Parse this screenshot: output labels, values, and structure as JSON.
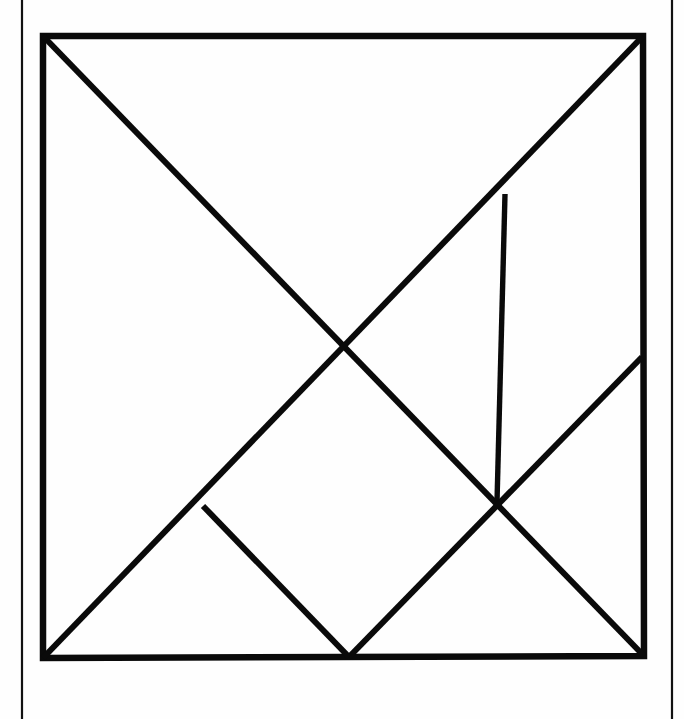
{
  "page": {
    "background_color": "#fefefe",
    "ink_color": "#0a0a0a",
    "width": 684,
    "height": 719,
    "margin_rules": {
      "name": "page-margin-rules",
      "left_x": 22,
      "right_x": 672,
      "top_y": 0,
      "bottom_y": 719,
      "stroke_width": 2.2,
      "color": "#111111"
    }
  },
  "figure": {
    "name": "tangram-square",
    "square": {
      "top_left": [
        43,
        36
      ],
      "top_right": [
        643,
        36
      ],
      "bottom_right": [
        644,
        656
      ],
      "bottom_left": [
        43,
        658
      ],
      "outline_path": "M 43 36 L 643 36 L 644 656 L 43 658 Z",
      "stroke_width": 6.5
    },
    "cuts": [
      {
        "name": "main-diagonal",
        "from": [
          43,
          36
        ],
        "to": [
          644,
          656
        ],
        "path": "M 43 36 L 644 656",
        "stroke_width": 6.0
      },
      {
        "name": "anti-diagonal",
        "from": [
          43,
          658
        ],
        "to": [
          643,
          36
        ],
        "path": "M 43 658 L 643 36",
        "stroke_width": 6.0
      },
      {
        "name": "vertical-cut",
        "from": [
          505,
          194
        ],
        "to": [
          497,
          502
        ],
        "path": "M 505 194 L 497 502",
        "stroke_width": 5.4
      },
      {
        "name": "right-lower-diagonal",
        "from": [
          642,
          357
        ],
        "to": [
          349,
          657
        ],
        "path": "M 642 357 L 349 657",
        "stroke_width": 6.0
      },
      {
        "name": "left-lower-diagonal",
        "from": [
          203,
          506
        ],
        "to": [
          349,
          657
        ],
        "path": "M 203 506 L 349 657",
        "stroke_width": 6.0
      }
    ],
    "vertices": [
      {
        "name": "center-crossing",
        "point": [
          340,
          348
        ]
      },
      {
        "name": "vertical-top-junction",
        "point": [
          505,
          194
        ]
      },
      {
        "name": "right-triple-junction",
        "point": [
          497,
          502
        ]
      },
      {
        "name": "left-junction",
        "point": [
          203,
          506
        ]
      },
      {
        "name": "bottom-apex",
        "point": [
          349,
          657
        ]
      },
      {
        "name": "right-edge-junction",
        "point": [
          642,
          357
        ]
      }
    ]
  }
}
